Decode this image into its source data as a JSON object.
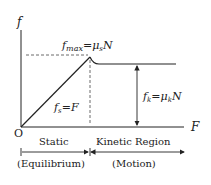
{
  "diagram": {
    "axis_y_label": "f",
    "axis_x_label": "F",
    "origin_label": "O",
    "fmax_label": {
      "f": "f",
      "sub": "max",
      "eq": "=",
      "mu": "μ",
      "mu_sub": "s",
      "N": "N"
    },
    "fs_label": {
      "f": "f",
      "sub": "s",
      "eq": "=",
      "F": "F"
    },
    "fk_label": {
      "f": "f",
      "sub": "k",
      "eq": "=",
      "mu": "μ",
      "mu_sub": "k",
      "N": "N"
    },
    "regions": {
      "static": "Static",
      "kinetic": "Kinetic Region",
      "static_sub": "(Equilibrium)",
      "kinetic_sub": "(Motion)"
    },
    "colors": {
      "line": "#222222",
      "dash": "#444444"
    }
  }
}
